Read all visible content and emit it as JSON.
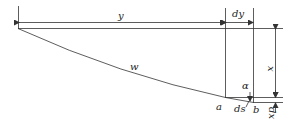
{
  "diagram": {
    "labels": {
      "y": "y",
      "dy": "dy",
      "x": "x",
      "w": "w",
      "a_angle": "α",
      "a_point": "a",
      "b_point": "b",
      "ds": "ds",
      "dx": "dx"
    },
    "colors": {
      "line": "#333333",
      "background": "#ffffff"
    }
  }
}
